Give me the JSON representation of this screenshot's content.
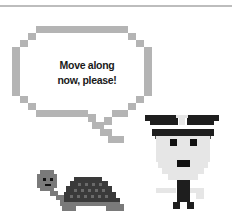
{
  "scene": {
    "type": "pixel-art illustration",
    "speech_bubble": {
      "line1": "Move along",
      "line2": "now, please!"
    },
    "characters": [
      {
        "name": "turtle",
        "role": "listener"
      },
      {
        "name": "officer",
        "role": "speaker"
      }
    ],
    "colors": {
      "bubble_outline": "#b4b4b4",
      "turtle_skin": "#7a7a7a",
      "turtle_shell": "#3a3a3a",
      "turtle_shell_spots": "#6a6a6a",
      "officer_face": "#e6e6e6",
      "officer_hat": "#1e1e1e",
      "officer_features": "#111111",
      "rule": "#bdbdbd"
    }
  }
}
